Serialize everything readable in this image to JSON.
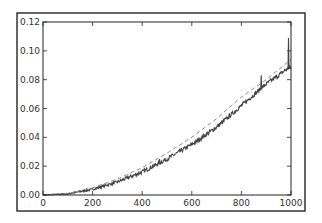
{
  "chart_data": {
    "type": "line",
    "title": "",
    "xlabel": "",
    "ylabel": "",
    "xlim": [
      0,
      1000
    ],
    "ylim": [
      0.0,
      0.12
    ],
    "grid": false,
    "legend": null,
    "x_ticks": [
      0,
      200,
      400,
      600,
      800,
      1000
    ],
    "x_tick_labels": [
      "0",
      "200",
      "400",
      "600",
      "800",
      "1000"
    ],
    "y_ticks": [
      0.0,
      0.02,
      0.04,
      0.06,
      0.08,
      0.1,
      0.12
    ],
    "y_tick_labels": [
      "0.00",
      "0.02",
      "0.04",
      "0.06",
      "0.08",
      "0.10",
      "0.12"
    ],
    "series": [
      {
        "name": "measured (noisy, solid)",
        "style": "solid",
        "color": "#444444",
        "x": [
          0,
          100,
          200,
          300,
          400,
          500,
          600,
          700,
          800,
          900,
          950,
          980,
          990,
          1000
        ],
        "values": [
          0.0,
          0.0008,
          0.004,
          0.009,
          0.016,
          0.025,
          0.035,
          0.047,
          0.062,
          0.077,
          0.083,
          0.087,
          0.108,
          0.088
        ],
        "noise_amplitude": 0.003,
        "spikes": [
          {
            "x": 340,
            "y": 0.013
          },
          {
            "x": 470,
            "y": 0.025
          },
          {
            "x": 880,
            "y": 0.083
          },
          {
            "x": 990,
            "y": 0.109
          }
        ]
      },
      {
        "name": "reference (dashed)",
        "style": "dashed",
        "color": "#888888",
        "x": [
          0,
          100,
          200,
          300,
          400,
          500,
          600,
          700,
          800,
          900,
          1000
        ],
        "values": [
          0.0,
          0.0011,
          0.005,
          0.011,
          0.019,
          0.029,
          0.04,
          0.053,
          0.068,
          0.08,
          0.094
        ]
      }
    ]
  }
}
